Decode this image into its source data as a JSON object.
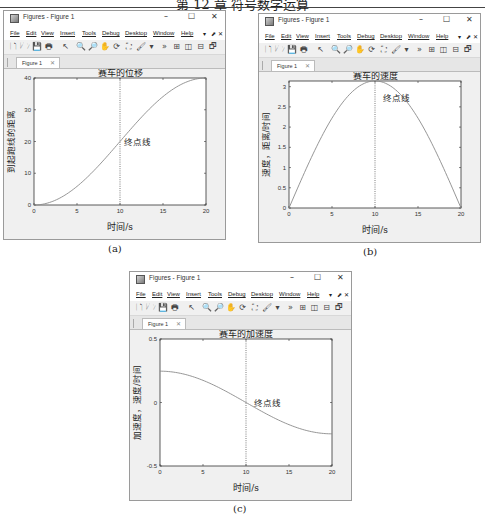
{
  "page_header": "第 12 章  符号数学运算",
  "window": {
    "title": "Figures - Figure 1",
    "controls": {
      "minimize": "–",
      "maximize": "☐",
      "close": "✕"
    },
    "menu": [
      "File",
      "Edit",
      "View",
      "Insert",
      "Tools",
      "Debug",
      "Desktop",
      "Window",
      "Help"
    ],
    "menu_extra": [
      "▾",
      "⬈",
      "✕"
    ],
    "tab_label": "Figure 1",
    "tab_close": "✕",
    "toolbar_icons": [
      "new-figure-icon",
      "open-icon",
      "save-icon",
      "print-icon",
      "pointer-icon",
      "zoom-in-icon",
      "zoom-out-icon",
      "pan-icon",
      "rotate-icon",
      "data-cursor-icon",
      "brush-icon",
      "more-icon",
      "tile-icon",
      "left-right-icon",
      "top-bottom-icon",
      "float-icon",
      "maximize-icon"
    ]
  },
  "captions": [
    "(a)",
    "(b)",
    "(c)"
  ],
  "chart_data": [
    {
      "type": "line",
      "title": "赛车的位移",
      "xlabel": "时间/s",
      "ylabel": "到起跑线的距离",
      "xlim": [
        0,
        20
      ],
      "ylim": [
        0,
        40
      ],
      "xticks": [
        0,
        5,
        10,
        15,
        20
      ],
      "yticks": [
        0,
        10,
        20,
        30,
        40
      ],
      "series": [
        {
          "name": "s(t)",
          "x": [
            0,
            2,
            4,
            6,
            8,
            10,
            12,
            14,
            16,
            18,
            20
          ],
          "values": [
            0,
            0.98,
            3.82,
            8.24,
            13.82,
            20,
            26.18,
            31.76,
            36.18,
            39.02,
            40
          ]
        }
      ],
      "annotation": {
        "text": "终点线",
        "x": 10,
        "y": 20
      },
      "vline": 10,
      "grid": false
    },
    {
      "type": "line",
      "title": "赛车的速度",
      "xlabel": "时间/s",
      "ylabel": "速度，距离/时间",
      "xlim": [
        0,
        20
      ],
      "ylim": [
        0,
        3.14
      ],
      "xticks": [
        0,
        5,
        10,
        15,
        20
      ],
      "yticks": [
        0,
        0.5,
        1,
        1.5,
        2,
        2.5,
        3
      ],
      "series": [
        {
          "name": "v(t)",
          "x": [
            0,
            2,
            4,
            6,
            8,
            10,
            12,
            14,
            16,
            18,
            20
          ],
          "values": [
            0,
            0.97,
            1.85,
            2.54,
            2.99,
            3.14,
            2.99,
            2.54,
            1.85,
            0.97,
            0
          ]
        }
      ],
      "annotation": {
        "text": "终点线",
        "x": 10.5,
        "y": 2.85
      },
      "vline": 10,
      "grid": false
    },
    {
      "type": "line",
      "title": "赛车的加速度",
      "xlabel": "时间/s",
      "ylabel": "加速度，速度/时间",
      "xlim": [
        0,
        20
      ],
      "ylim": [
        -0.5,
        0.5
      ],
      "xticks": [
        0,
        5,
        10,
        15,
        20
      ],
      "yticks": [
        -0.5,
        0,
        0.5
      ],
      "series": [
        {
          "name": "a(t)",
          "x": [
            0,
            2,
            4,
            6,
            8,
            10,
            12,
            14,
            16,
            18,
            20
          ],
          "values": [
            0.493,
            0.469,
            0.399,
            0.29,
            0.152,
            0,
            -0.152,
            -0.29,
            -0.399,
            -0.469,
            -0.493
          ]
        }
      ],
      "annotation": {
        "text": "终点线",
        "x": 10.5,
        "y": 0
      },
      "vline": 10,
      "grid": false
    }
  ]
}
